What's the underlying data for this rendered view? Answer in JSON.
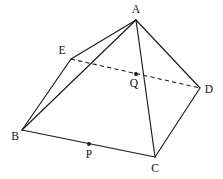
{
  "figure": {
    "background_color": "#ffffff",
    "line_color": "#1a1a1a",
    "width": 223,
    "height": 179
  },
  "vertices": [
    {
      "id": "A",
      "label": "A",
      "x": 136,
      "y": 20,
      "label_x": 136,
      "label_y": 10
    },
    {
      "id": "E",
      "label": "E",
      "x": 71,
      "y": 59,
      "label_x": 62,
      "label_y": 51
    },
    {
      "id": "D",
      "label": "D",
      "x": 200,
      "y": 88,
      "label_x": 209,
      "label_y": 90
    },
    {
      "id": "B",
      "label": "B",
      "x": 22,
      "y": 130,
      "label_x": 15,
      "label_y": 137
    },
    {
      "id": "C",
      "label": "C",
      "x": 155,
      "y": 157,
      "label_x": 155,
      "label_y": 169
    }
  ],
  "points": [
    {
      "id": "P",
      "label": "P",
      "x": 89,
      "y": 144,
      "label_x": 89,
      "label_y": 155,
      "on_segment": "BC"
    },
    {
      "id": "Q",
      "label": "Q",
      "x": 136,
      "y": 74,
      "label_x": 134,
      "label_y": 84,
      "on_segment": "ED and AC"
    }
  ],
  "edges": [
    {
      "id": "AE",
      "from": "A",
      "to": "E",
      "style": "solid"
    },
    {
      "id": "AB",
      "from": "A",
      "to": "B",
      "style": "solid"
    },
    {
      "id": "AC",
      "from": "A",
      "to": "C",
      "style": "solid"
    },
    {
      "id": "AD",
      "from": "A",
      "to": "D",
      "style": "solid"
    },
    {
      "id": "BE",
      "from": "B",
      "to": "E",
      "style": "solid"
    },
    {
      "id": "BC",
      "from": "B",
      "to": "C",
      "style": "solid"
    },
    {
      "id": "CD",
      "from": "C",
      "to": "D",
      "style": "solid"
    },
    {
      "id": "ED",
      "from": "E",
      "to": "D",
      "style": "dashed"
    }
  ]
}
